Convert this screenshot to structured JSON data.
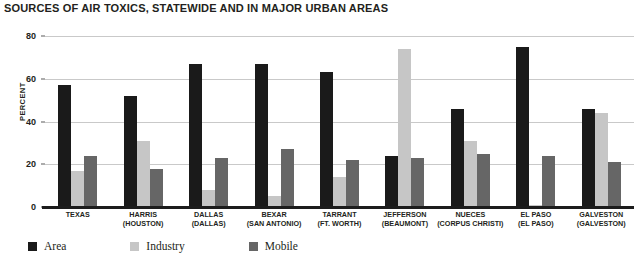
{
  "chart_data": {
    "type": "bar",
    "title": "SOURCES OF AIR TOXICS, STATEWIDE AND IN MAJOR URBAN AREAS",
    "xlabel": "",
    "ylabel": "PERCENT",
    "ylim": [
      0,
      80
    ],
    "yticks": [
      0,
      20,
      40,
      60,
      80
    ],
    "grid": true,
    "legend_position": "bottom-left",
    "categories": [
      "TEXAS",
      "HARRIS",
      "DALLAS",
      "BEXAR",
      "TARRANT",
      "JEFFERSON",
      "NUECES",
      "EL PASO",
      "GALVESTON"
    ],
    "category_sublabels": [
      "",
      "(HOUSTON)",
      "(DALLAS)",
      "(SAN ANTONIO)",
      "(FT. WORTH)",
      "(BEAUMONT)",
      "(CORPUS CHRISTI)",
      "(EL PASO)",
      "(GALVESTON)"
    ],
    "series": [
      {
        "name": "Area",
        "color": "#1a1a1a",
        "values": [
          57,
          52,
          67,
          67,
          63,
          24,
          46,
          75,
          46
        ]
      },
      {
        "name": "Industry",
        "color": "#c6c6c6",
        "values": [
          17,
          31,
          8,
          5,
          14,
          74,
          31,
          1,
          44
        ]
      },
      {
        "name": "Mobile",
        "color": "#666666",
        "values": [
          24,
          18,
          23,
          27,
          22,
          23,
          25,
          24,
          21
        ]
      }
    ]
  }
}
